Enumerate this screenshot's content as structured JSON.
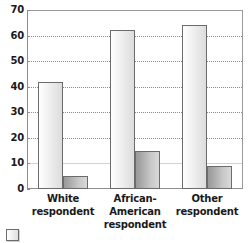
{
  "chart_data": {
    "type": "bar",
    "title": "",
    "subtitle": "",
    "xlabel": "",
    "ylabel": "",
    "ylim": [
      0,
      70
    ],
    "ytick_values": [
      0,
      10,
      20,
      30,
      40,
      50,
      60,
      70
    ],
    "ytick_labels": [
      "0",
      "10",
      "20",
      "30",
      "40",
      "50",
      "60",
      "70"
    ],
    "grid": true,
    "grid_axis": "y",
    "legend_position": "bottom-left",
    "orientation": "vertical",
    "grouping": "grouped",
    "categories": [
      "White respondent",
      "African-American respondent",
      "Other respondent"
    ],
    "category_lines": [
      [
        "White",
        "respondent"
      ],
      [
        "African-American",
        "respondent"
      ],
      [
        "Other",
        "respondent"
      ]
    ],
    "series": [
      {
        "name": "",
        "color": "#f0f0f0",
        "values": [
          42,
          62,
          64
        ]
      },
      {
        "name": "",
        "color": "#b4b4b4",
        "values": [
          5,
          15,
          9
        ]
      }
    ],
    "legend_entries": [
      {
        "label": "",
        "color": "#f0f0f0"
      }
    ]
  },
  "colors": {
    "axis": "#8d8d8d",
    "frame": "#9a9a9a",
    "gridline": "#8a8a8a",
    "text": "#1a1a1a",
    "bar_border": "#6b6b6b",
    "series_a": "#f0f0f0",
    "series_b": "#b4b4b4",
    "background": "#ffffff"
  }
}
